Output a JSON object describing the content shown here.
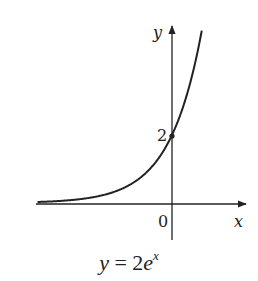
{
  "chart_data": {
    "type": "line",
    "function": "y = 2e^x",
    "xlabel": "x",
    "ylabel": "y",
    "x_tick_labels": [
      "0"
    ],
    "y_tick_labels": [
      "2"
    ],
    "marked_points": [
      {
        "x": 0,
        "y": 2,
        "label": "2"
      }
    ],
    "x": [
      -4.2,
      -3,
      -2,
      -1,
      -0.5,
      0,
      0.5,
      0.93
    ],
    "values": [
      0.03,
      0.1,
      0.27,
      0.74,
      1.21,
      2.0,
      3.3,
      5.07
    ],
    "xlim": [
      -4.3,
      2.1
    ],
    "ylim": [
      -1,
      5.3
    ],
    "grid": false,
    "legend": null
  },
  "labels": {
    "y_axis": "y",
    "x_axis": "x",
    "origin": "0",
    "intercept": "2",
    "caption_lhs": "y",
    "caption_eq": " = 2",
    "caption_base": "e",
    "caption_exp": "x"
  }
}
